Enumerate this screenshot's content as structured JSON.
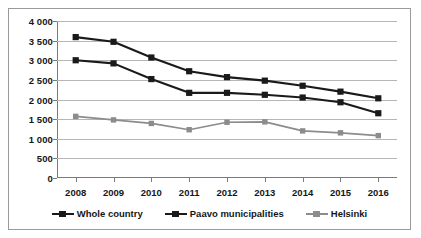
{
  "chart_data": {
    "type": "line",
    "title": "",
    "xlabel": "",
    "ylabel": "",
    "categories": [
      "2008",
      "2009",
      "2010",
      "2011",
      "2012",
      "2013",
      "2014",
      "2015",
      "2016"
    ],
    "ylim": [
      0,
      4000
    ],
    "yticks": [
      0,
      500,
      1000,
      1500,
      2000,
      2500,
      3000,
      3500,
      4000
    ],
    "ytick_labels": [
      "0",
      "500",
      "1 000",
      "1 500",
      "2 000",
      "2 500",
      "3 000",
      "3 500",
      "4 000"
    ],
    "grid": true,
    "legend_position": "bottom",
    "series": [
      {
        "name": "Whole country",
        "color": "#1a1a1a",
        "marker": "square",
        "values": [
          3590,
          3470,
          3070,
          2720,
          2570,
          2480,
          2350,
          2200,
          2030
        ]
      },
      {
        "name": "Paavo municipalities",
        "color": "#1a1a1a",
        "marker": "square",
        "values": [
          3000,
          2920,
          2520,
          2170,
          2170,
          2120,
          2050,
          1930,
          1650
        ]
      },
      {
        "name": "Helsinki",
        "color": "#8c8c8c",
        "marker": "square",
        "values": [
          1570,
          1480,
          1390,
          1230,
          1420,
          1430,
          1200,
          1150,
          1080
        ]
      }
    ]
  },
  "axis": {
    "gridline_color": "#b6b6b6",
    "axis_color": "#7a7a7a"
  },
  "frame": {
    "border_color": "#9a9a9a",
    "background": "#ffffff"
  }
}
